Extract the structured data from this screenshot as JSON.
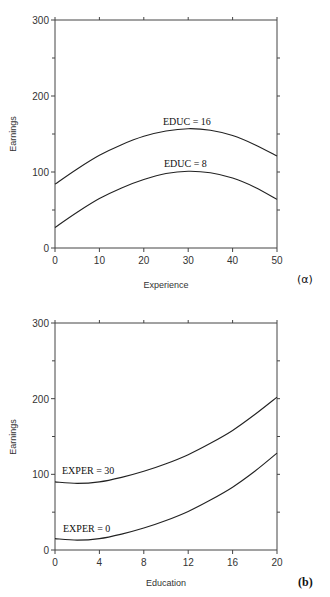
{
  "chart_data": [
    {
      "type": "line",
      "panel": "(a)",
      "title": "",
      "xlabel": "Experience",
      "ylabel": "Earnings",
      "xlim": [
        0,
        50
      ],
      "ylim": [
        0,
        300
      ],
      "x_ticks": [
        0,
        10,
        20,
        30,
        40,
        50
      ],
      "y_ticks": [
        0,
        100,
        200,
        300
      ],
      "grid": false,
      "x": [
        0,
        5,
        10,
        15,
        20,
        25,
        30,
        35,
        40,
        45,
        50
      ],
      "series": [
        {
          "name": "EDUC = 16",
          "values": [
            84,
            104,
            122,
            136,
            147,
            154,
            157,
            155,
            148,
            136,
            121
          ]
        },
        {
          "name": "EDUC = 8",
          "values": [
            27,
            47,
            65,
            79,
            90,
            98,
            101,
            99,
            92,
            80,
            64
          ]
        }
      ],
      "annotations": [
        "EDUC = 16",
        "EDUC = 8"
      ]
    },
    {
      "type": "line",
      "panel": "(b)",
      "title": "",
      "xlabel": "Education",
      "ylabel": "Earnings",
      "xlim": [
        0,
        20
      ],
      "ylim": [
        0,
        300
      ],
      "x_ticks": [
        0,
        4,
        8,
        12,
        16,
        20
      ],
      "y_ticks": [
        0,
        100,
        200,
        300
      ],
      "grid": false,
      "x": [
        0,
        2,
        4,
        6,
        8,
        10,
        12,
        14,
        16,
        18,
        20
      ],
      "series": [
        {
          "name": "EXPER = 30",
          "values": [
            90,
            88,
            90,
            96,
            104,
            114,
            126,
            141,
            158,
            179,
            202
          ]
        },
        {
          "name": "EXPER = 0",
          "values": [
            15,
            13,
            15,
            21,
            29,
            39,
            51,
            66,
            83,
            104,
            128
          ]
        }
      ],
      "annotations": [
        "EXPER = 30",
        "EXPER = 0"
      ]
    }
  ],
  "panels": {
    "a": {
      "ylabel": "Earnings",
      "xlabel": "Experience",
      "panel_label": "(α)",
      "y_tick_labels": [
        "0",
        "100",
        "200",
        "300"
      ],
      "x_tick_labels": [
        "0",
        "10",
        "20",
        "30",
        "40",
        "50"
      ],
      "curve_labels": [
        "EDUC = 16",
        "EDUC = 8"
      ]
    },
    "b": {
      "ylabel": "Earnings",
      "xlabel": "Education",
      "panel_label": "(b)",
      "y_tick_labels": [
        "0",
        "100",
        "200",
        "300"
      ],
      "x_tick_labels": [
        "0",
        "4",
        "8",
        "12",
        "16",
        "20"
      ],
      "curve_labels": [
        "EXPER = 30",
        "EXPER = 0"
      ]
    }
  },
  "colors": {
    "axis": "#444444",
    "curve": "#222222",
    "background": "#ffffff"
  }
}
